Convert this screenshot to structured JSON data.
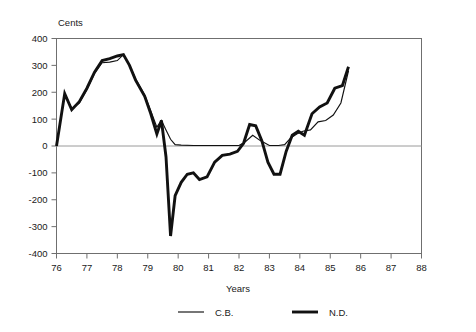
{
  "chart_data": {
    "type": "line",
    "title": "",
    "xlabel": "Years",
    "ylabel": "Cents",
    "xlim": [
      76,
      88
    ],
    "ylim": [
      -400,
      400
    ],
    "grid": false,
    "zero_line": true,
    "legend_position": "bottom",
    "x_ticks": [
      "76",
      "77",
      "78",
      "79",
      "80",
      "81",
      "82",
      "83",
      "84",
      "85",
      "86",
      "87",
      "88"
    ],
    "y_ticks": [
      "400",
      "300",
      "200",
      "100",
      "0",
      "-100",
      "-200",
      "-300",
      "-400"
    ],
    "series": [
      {
        "name": "C.B.",
        "style": "thin",
        "x": [
          76.0,
          76.27,
          76.5,
          76.75,
          77.0,
          77.25,
          77.5,
          77.75,
          78.0,
          78.2,
          78.4,
          78.6,
          78.9,
          79.1,
          79.3,
          79.45,
          79.6,
          79.75,
          79.9,
          80.1,
          80.5,
          81.0,
          81.5,
          82.0,
          82.2,
          82.45,
          82.7,
          83.0,
          83.3,
          83.5,
          83.7,
          83.9,
          84.1,
          84.35,
          84.6,
          84.85,
          85.1,
          85.35,
          85.6
        ],
        "y": [
          0,
          190,
          140,
          160,
          210,
          270,
          310,
          312,
          318,
          340,
          300,
          250,
          190,
          130,
          70,
          95,
          60,
          25,
          5,
          3,
          2,
          2,
          2,
          2,
          15,
          40,
          20,
          2,
          2,
          5,
          30,
          45,
          55,
          60,
          90,
          95,
          115,
          160,
          280
        ]
      },
      {
        "name": "N.D.",
        "style": "thick",
        "x": [
          76.0,
          76.27,
          76.5,
          76.75,
          77.0,
          77.25,
          77.5,
          77.75,
          78.0,
          78.2,
          78.4,
          78.6,
          78.9,
          79.1,
          79.3,
          79.45,
          79.6,
          79.75,
          79.9,
          80.1,
          80.3,
          80.5,
          80.7,
          80.95,
          81.2,
          81.45,
          81.7,
          81.95,
          82.15,
          82.35,
          82.55,
          82.75,
          82.95,
          83.15,
          83.35,
          83.55,
          83.75,
          83.95,
          84.15,
          84.4,
          84.65,
          84.9,
          85.15,
          85.4,
          85.6
        ],
        "y": [
          0,
          195,
          135,
          165,
          215,
          275,
          318,
          325,
          335,
          340,
          300,
          245,
          185,
          120,
          45,
          95,
          -40,
          -335,
          -185,
          -135,
          -105,
          -100,
          -125,
          -115,
          -60,
          -35,
          -30,
          -20,
          10,
          80,
          75,
          20,
          -60,
          -105,
          -105,
          -20,
          40,
          55,
          40,
          120,
          145,
          160,
          215,
          225,
          295
        ]
      }
    ]
  },
  "legend": {
    "items": [
      {
        "label": "C.B.",
        "style": "thin"
      },
      {
        "label": "N.D.",
        "style": "thick"
      }
    ]
  },
  "colors": {
    "line": "#111111",
    "axis": "#6f6f6f",
    "text": "#1a1a1a",
    "zero_line": "#9a9a9a"
  }
}
